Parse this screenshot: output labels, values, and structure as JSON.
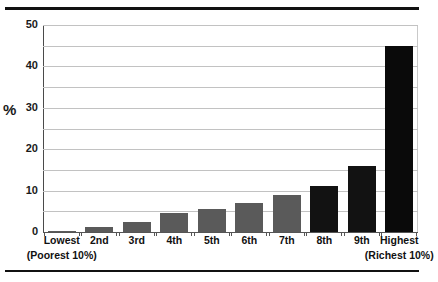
{
  "chart_data": {
    "type": "bar",
    "title": "",
    "xlabel": "",
    "ylabel": "%",
    "ylim": [
      0,
      50
    ],
    "ytick_labels": [
      "0",
      "10",
      "20",
      "30",
      "40",
      "50"
    ],
    "ytick_values": [
      0,
      10,
      20,
      30,
      40,
      50
    ],
    "gridline_values": [
      0,
      5,
      10,
      15,
      20,
      25,
      30,
      35,
      40,
      45,
      50
    ],
    "grid": true,
    "legend": "none",
    "categories": [
      "Lowest",
      "2nd",
      "3rd",
      "4th",
      "5th",
      "6th",
      "7th",
      "8th",
      "9th",
      "Highest"
    ],
    "category_sublabels": [
      "(Poorest 10%)",
      "",
      "",
      "",
      "",
      "",
      "",
      "",
      "",
      "(Richest 10%)"
    ],
    "values": [
      0.2,
      1.2,
      2.5,
      4.5,
      5.5,
      7.0,
      9.0,
      11.0,
      16.0,
      45.0
    ],
    "bar_colors": [
      "#5a5a5a",
      "#5a5a5a",
      "#5a5a5a",
      "#5a5a5a",
      "#5a5a5a",
      "#5a5a5a",
      "#5a5a5a",
      "#121212",
      "#121212",
      "#0a0a0a"
    ],
    "colors": {
      "gray_bar": "#5a5a5a",
      "dark_bar": "#121212",
      "gridline": "#c2c2c2",
      "axis": "#555555",
      "text": "#111111",
      "rule": "#111111",
      "background": "#ffffff"
    }
  }
}
